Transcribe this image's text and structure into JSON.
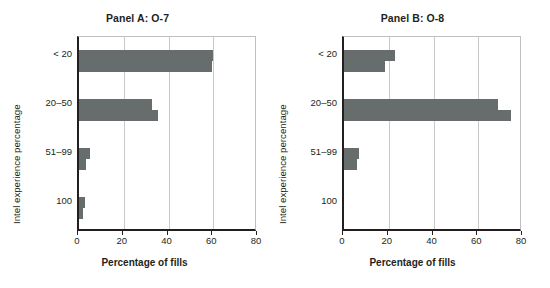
{
  "figure": {
    "background": "#ffffff",
    "bar_color": "#676c6c",
    "grid_color": "#c9c9c9",
    "axis_color": "#231f20"
  },
  "chart_data": {
    "type": "bar",
    "orientation": "horizontal",
    "title": "",
    "xlabel": "Percentage of fills",
    "ylabel": "Intel experience percentage",
    "categories": [
      "< 20",
      "20–50",
      "51–99",
      "100"
    ],
    "xlim": [
      0,
      80
    ],
    "xticks": [
      0,
      20,
      40,
      60,
      80
    ],
    "xtick_labels": [
      "0",
      "20",
      "40",
      "60",
      "80"
    ],
    "grid": "vertical",
    "legend": "none",
    "panels": [
      {
        "id": "panel-a",
        "title": "Panel A: O-7",
        "xlabel": "Percentage of fills",
        "ylabel": "Intel experience percentage",
        "categories": [
          "< 20",
          "20–50",
          "51–99",
          "100"
        ],
        "series": [
          {
            "name": "upper",
            "values": [
              60.0,
              32.5,
              5.0,
              2.5
            ]
          },
          {
            "name": "lower",
            "values": [
              59.5,
              35.5,
              3.0,
              2.0
            ]
          }
        ]
      },
      {
        "id": "panel-b",
        "title": "Panel B: O-8",
        "xlabel": "Percentage of fills",
        "ylabel": "Intel experience percentage",
        "categories": [
          "< 20",
          "20–50",
          "51–99",
          "100"
        ],
        "series": [
          {
            "name": "upper",
            "values": [
              23.0,
              69.0,
              6.5,
              0.0
            ]
          },
          {
            "name": "lower",
            "values": [
              18.5,
              74.5,
              6.0,
              0.0
            ]
          }
        ]
      }
    ]
  }
}
